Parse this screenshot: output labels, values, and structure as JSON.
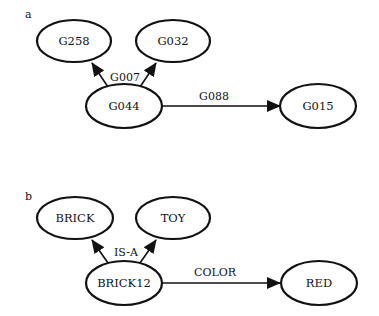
{
  "diagrams": [
    {
      "panel_label": "a",
      "nodes": {
        "top_left": "G258",
        "top_right": "G032",
        "center": "G044",
        "right": "G015"
      },
      "edges": {
        "up_label": "G007",
        "right_label": "G088"
      }
    },
    {
      "panel_label": "b",
      "nodes": {
        "top_left": "BRICK",
        "top_right": "TOY",
        "center": "BRICK12",
        "right": "RED"
      },
      "edges": {
        "up_label": "IS-A",
        "right_label": "COLOR"
      }
    }
  ],
  "colors": {
    "stroke": "#111111",
    "background": "#ffffff"
  }
}
